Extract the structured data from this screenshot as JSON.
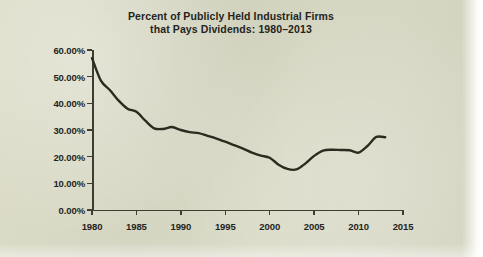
{
  "figure": {
    "background_color": "#d7d8c4",
    "ink_color": "#2b2b20",
    "title_line_1": "Percent of Publicly Held Industrial Firms",
    "title_line_2": "that Pays Dividends: 1980–2013"
  },
  "chart_data": {
    "type": "line",
    "title": "Percent of Publicly Held Industrial Firms that Pays Dividends: 1980–2013",
    "title_lines": [
      "Percent of Publicly Held Industrial Firms",
      "that Pays Dividends: 1980–2013"
    ],
    "xlabel": "",
    "ylabel": "",
    "xlim": [
      1980,
      2015
    ],
    "ylim": [
      0,
      60
    ],
    "grid": false,
    "legend": false,
    "legend_position": "none",
    "x_tick_labels": [
      "1980",
      "1985",
      "1990",
      "1995",
      "2000",
      "2005",
      "2010",
      "2015"
    ],
    "x_ticks": [
      1980,
      1985,
      1990,
      1995,
      2000,
      2005,
      2010,
      2015
    ],
    "y_tick_labels": [
      "0.00%",
      "10.00%",
      "20.00%",
      "30.00%",
      "40.00%",
      "50.00%",
      "60.00%"
    ],
    "y_ticks": [
      0,
      10,
      20,
      30,
      40,
      50,
      60
    ],
    "y_unit": "%",
    "series": [
      {
        "name": "Percent of publicly held industrial firms that pay dividends",
        "color": "#2b2b20",
        "x": [
          1980,
          1981,
          1982,
          1983,
          1984,
          1985,
          1986,
          1987,
          1988,
          1989,
          1990,
          1991,
          1992,
          1993,
          1994,
          1995,
          1996,
          1997,
          1998,
          1999,
          2000,
          2001,
          2002,
          2003,
          2004,
          2005,
          2006,
          2007,
          2008,
          2009,
          2010,
          2011,
          2012,
          2013
        ],
        "values": [
          57.0,
          48.5,
          45.0,
          41.0,
          38.0,
          36.8,
          33.5,
          30.6,
          30.4,
          31.1,
          30.0,
          29.2,
          28.8,
          27.8,
          26.8,
          25.6,
          24.3,
          23.0,
          21.5,
          20.4,
          19.6,
          17.0,
          15.4,
          15.2,
          17.4,
          20.3,
          22.3,
          22.6,
          22.5,
          22.4,
          21.5,
          24.0,
          27.4,
          27.3
        ]
      }
    ]
  },
  "axes": {
    "y_labels": [
      "60.00%",
      "50.00%",
      "40.00%",
      "30.00%",
      "20.00%",
      "10.00%",
      "0.00%"
    ],
    "x_labels": [
      "1980",
      "1985",
      "1990",
      "1995",
      "2000",
      "2005",
      "2010",
      "2015"
    ]
  }
}
